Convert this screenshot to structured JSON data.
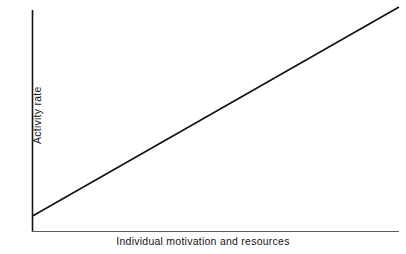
{
  "chart_data": {
    "type": "line",
    "title": "",
    "subtitle": "",
    "xlabel": "Individual motivation and resources",
    "ylabel": "Activity rate",
    "xlim": [
      0,
      100
    ],
    "ylim": [
      0,
      100
    ],
    "grid": false,
    "legend": false,
    "legend_position": "none",
    "xticks": [],
    "yticks": [],
    "xticklabels": [],
    "yticklabels": [],
    "annotations": [],
    "series": [
      {
        "name": "Activity rate vs individual motivation and resources",
        "style": "straight-line",
        "color": "#141414",
        "x": [
          0,
          25,
          50,
          75,
          100
        ],
        "y": [
          7,
          30.25,
          53.5,
          76.75,
          100
        ],
        "description": "Positive linear relationship rising steadily from a small positive intercept at the y-axis to the top right of the plot area"
      }
    ]
  },
  "figure": {
    "background_color": "#ffffff",
    "axis_color": "#141414",
    "x_axis_color": "#555555",
    "line_color": "#141414",
    "text_color": "#141414"
  }
}
